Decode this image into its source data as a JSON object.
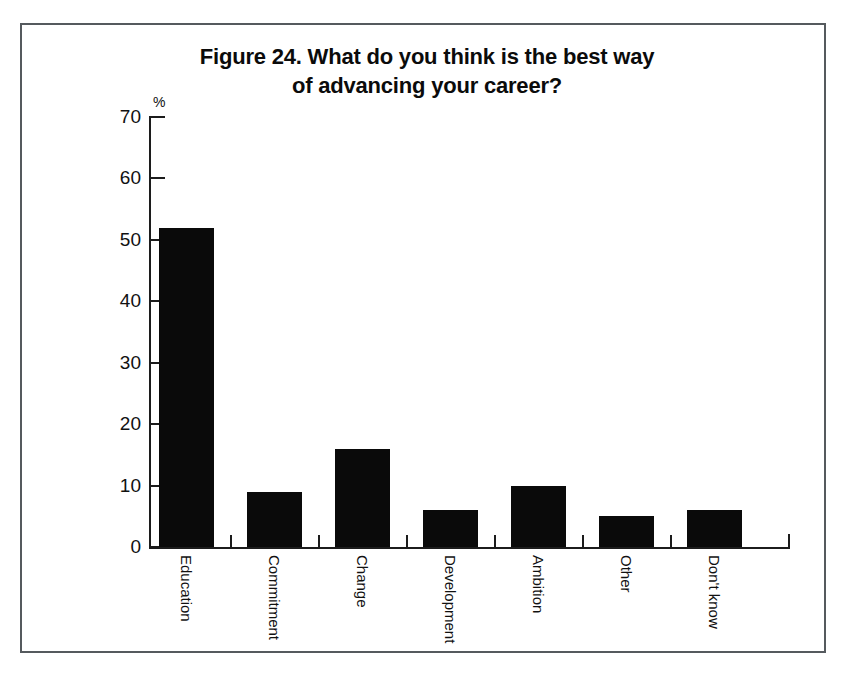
{
  "figure": {
    "title_line_1": "Figure 24. What do you think is the best way",
    "title_line_2": "of advancing your career?",
    "unit_label": "%",
    "border_color": "#555a5e",
    "bar_color": "#0a0a0a",
    "axis_color": "#1c1c1c"
  },
  "chart_data": {
    "type": "bar",
    "title": "Figure 24. What do you think is the best way of advancing your career?",
    "xlabel": "",
    "ylabel": "%",
    "ylim": [
      0,
      70
    ],
    "yticks": [
      0,
      10,
      20,
      30,
      40,
      50,
      60,
      70
    ],
    "grid": false,
    "legend": "none",
    "categories": [
      "Education",
      "Commitment",
      "Change",
      "Development",
      "Ambition",
      "Other",
      "Don't know"
    ],
    "values": [
      52,
      9,
      16,
      6,
      10,
      5,
      6
    ]
  }
}
